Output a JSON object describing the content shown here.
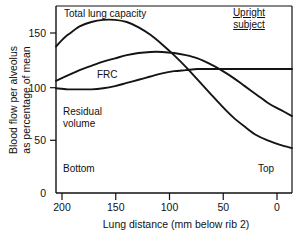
{
  "chart_data": {
    "type": "line",
    "title": "",
    "xlabel": "Lung distance (mm below rib 2)",
    "ylabel": "Blood flow per alveolus as percentage of mean",
    "xlim": [
      200,
      0
    ],
    "ylim": [
      0,
      175
    ],
    "xticks": [
      "200",
      "150",
      "100",
      "50",
      "0"
    ],
    "xtick_values": [
      200,
      150,
      100,
      50,
      0
    ],
    "yticks": [
      "0",
      "50",
      "100",
      "150"
    ],
    "ytick_values": [
      0,
      50,
      100,
      150
    ],
    "grid": false,
    "legend_position": "inline-annotations",
    "annotations": [
      {
        "text": "Upright",
        "role": "condition-line-1"
      },
      {
        "text": "subject",
        "role": "condition-line-2"
      },
      {
        "text": "Bottom",
        "role": "x-region-left"
      },
      {
        "text": "Top",
        "role": "x-region-right"
      }
    ],
    "series": [
      {
        "name": "Total lung capacity",
        "label": "Total lung capacity",
        "points": [
          [
            200,
            137
          ],
          [
            195,
            143
          ],
          [
            190,
            148
          ],
          [
            185,
            152
          ],
          [
            180,
            156
          ],
          [
            170,
            160
          ],
          [
            160,
            162
          ],
          [
            150,
            162
          ],
          [
            140,
            160
          ],
          [
            130,
            155
          ],
          [
            120,
            148
          ],
          [
            110,
            139
          ],
          [
            100,
            129
          ],
          [
            90,
            118
          ],
          [
            80,
            106
          ],
          [
            70,
            94
          ],
          [
            60,
            82
          ],
          [
            50,
            71
          ],
          [
            40,
            62
          ],
          [
            30,
            54
          ],
          [
            20,
            49
          ],
          [
            10,
            45
          ],
          [
            0,
            42
          ]
        ]
      },
      {
        "name": "FRC",
        "label": "FRC",
        "points": [
          [
            200,
            105
          ],
          [
            190,
            110
          ],
          [
            180,
            115
          ],
          [
            170,
            119
          ],
          [
            160,
            123
          ],
          [
            150,
            126
          ],
          [
            140,
            129
          ],
          [
            130,
            131
          ],
          [
            120,
            132
          ],
          [
            110,
            132
          ],
          [
            100,
            131
          ],
          [
            90,
            129
          ],
          [
            80,
            126
          ],
          [
            70,
            121
          ],
          [
            60,
            115
          ],
          [
            50,
            108
          ],
          [
            40,
            100
          ],
          [
            30,
            92
          ],
          [
            20,
            84
          ],
          [
            10,
            78
          ],
          [
            0,
            72
          ]
        ]
      },
      {
        "name": "Residual volume",
        "label": "Residual volume",
        "points": [
          [
            200,
            98
          ],
          [
            190,
            97
          ],
          [
            180,
            97
          ],
          [
            170,
            97
          ],
          [
            160,
            98
          ],
          [
            150,
            100
          ],
          [
            140,
            103
          ],
          [
            130,
            106
          ],
          [
            120,
            109
          ],
          [
            110,
            112
          ],
          [
            100,
            114
          ],
          [
            90,
            115
          ],
          [
            80,
            116
          ],
          [
            70,
            116
          ],
          [
            60,
            116
          ],
          [
            50,
            116
          ],
          [
            40,
            116
          ],
          [
            30,
            116
          ],
          [
            20,
            116
          ],
          [
            10,
            116
          ],
          [
            0,
            116
          ]
        ]
      }
    ]
  },
  "labels": {
    "y_axis_line1": "Blood flow per alveolus",
    "y_axis_line2": "as percentage of mean",
    "x_axis": "Lung distance (mm below rib 2)",
    "tlc": "Total lung capacity",
    "frc": "FRC",
    "rv_line1": "Residual",
    "rv_line2": "volume",
    "bottom": "Bottom",
    "top": "Top",
    "note_line1": "Upright",
    "note_line2": "subject",
    "ytick_150": "150",
    "ytick_100": "100",
    "ytick_50": "50",
    "ytick_0": "0",
    "xtick_200": "200",
    "xtick_150": "150",
    "xtick_100": "100",
    "xtick_50": "50",
    "xtick_0": "0"
  },
  "colors": {
    "ink": "#111111",
    "background": "#ffffff"
  }
}
